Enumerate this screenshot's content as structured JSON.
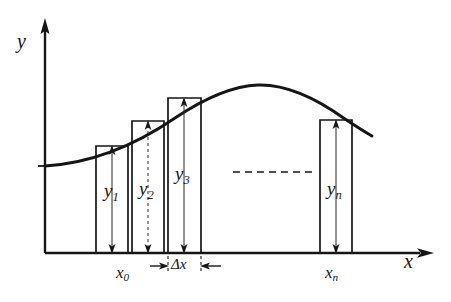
{
  "figure": {
    "type": "math-diagram",
    "background_color": "#ffffff",
    "ink_color": "#161616"
  },
  "axes": {
    "y_axis_label": "y",
    "x_axis_label": "x",
    "origin": {
      "x": 45,
      "y": 253
    },
    "y_axis_top": {
      "x": 45,
      "y": 22
    },
    "x_axis_right": {
      "x": 432,
      "y": 253
    }
  },
  "curve": {
    "description": "smooth concave curve rising to a peak then falling",
    "start": {
      "x": 45,
      "y": 166
    },
    "peak": {
      "x": 258,
      "y": 85
    },
    "end": {
      "x": 372,
      "y": 136
    }
  },
  "rectangles": [
    {
      "label": "y",
      "subscript": "1",
      "left": 96,
      "right": 128,
      "top": 146,
      "bottom": 253,
      "arrow": "up-down"
    },
    {
      "label": "y",
      "subscript": "2",
      "left": 132,
      "right": 164,
      "top": 121,
      "bottom": 253,
      "arrow": "up-down"
    },
    {
      "label": "y",
      "subscript": "3",
      "left": 168,
      "right": 201,
      "top": 98,
      "bottom": 253,
      "arrow": "up-down"
    },
    {
      "label": "y",
      "subscript": "n",
      "left": 320,
      "right": 352,
      "top": 120,
      "bottom": 253,
      "arrow": "up-down"
    }
  ],
  "labels": {
    "y_axis": "y",
    "x_axis": "x",
    "x_start": {
      "text": "x",
      "subscript": "0"
    },
    "x_end": {
      "text": "x",
      "subscript": "n"
    },
    "delta_x": "Δx",
    "heights": [
      "y₁",
      "y₂",
      "y₃",
      "yₙ"
    ]
  },
  "ellipsis_line": {
    "description": "dashed horizontal line indicating omitted rectangles",
    "from": {
      "x": 233,
      "y": 172
    },
    "to": {
      "x": 318,
      "y": 172
    }
  },
  "dimension_marker": {
    "label": "Δx",
    "left_tick_x": 168,
    "right_tick_x": 201,
    "y": 265
  }
}
